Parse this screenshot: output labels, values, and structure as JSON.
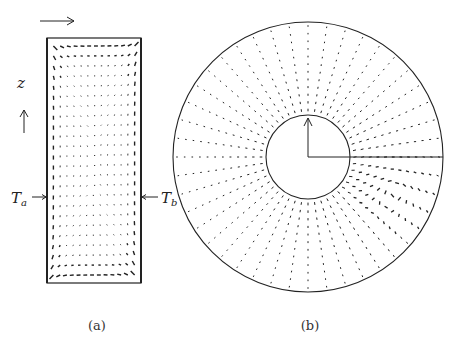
{
  "figure": {
    "panels": [
      {
        "id": "a",
        "caption": "(a)",
        "description": "Meridional cross-section of annular cavity showing velocity vector field",
        "labels": {
          "z_axis": "z",
          "left_wall": "T",
          "left_wall_sub": "a",
          "right_wall": "T",
          "right_wall_sub": "b"
        }
      },
      {
        "id": "b",
        "caption": "(b)",
        "description": "Horizontal cross-section of annulus showing velocity vector field with recirculation cell",
        "labels": {}
      }
    ],
    "colors": {
      "ink": "#222222",
      "background": "#ffffff"
    }
  },
  "geometry": {
    "panel_a": {
      "x0": 47,
      "y0": 38,
      "x1": 141,
      "y1": 283,
      "cols": 13,
      "rows": 24
    },
    "panel_b": {
      "cx": 308,
      "cy": 157,
      "r_outer": 135,
      "r_inner": 42,
      "spokes": 44,
      "rings": 12,
      "vortex": {
        "x": 395,
        "y": 193
      }
    }
  }
}
